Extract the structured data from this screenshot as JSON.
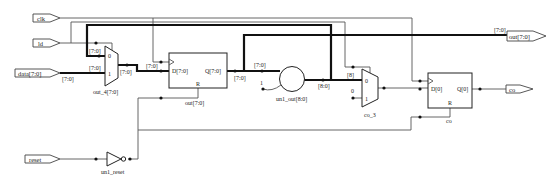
{
  "ports": {
    "inputs": [
      {
        "name": "clk",
        "label": "clk"
      },
      {
        "name": "ld",
        "label": "ld"
      },
      {
        "name": "data",
        "label": "data[7:0]"
      },
      {
        "name": "reset",
        "label": "reset"
      }
    ],
    "outputs": [
      {
        "name": "out",
        "label": "out[7:0]"
      },
      {
        "name": "co",
        "label": "co"
      }
    ]
  },
  "instances": {
    "mux_out4": {
      "label": "out_4[7:0]",
      "pin0": "0",
      "pin1": "1"
    },
    "reg_out": {
      "label": "out[7:0]",
      "pin_d": "D[7:0]",
      "pin_q": "Q[7:0]",
      "pin_r": "R"
    },
    "adder": {
      "label": "un1_out[8:0]",
      "const_in": "1"
    },
    "mux_co3": {
      "label": "co_3",
      "pin0": "0",
      "pin1": "1",
      "const_in": "0"
    },
    "ff_co": {
      "label": "co",
      "pin_d": "D[0]",
      "pin_q": "Q[0]",
      "pin_r": "R"
    },
    "inv_reset": {
      "label": "un1_reset"
    }
  },
  "bus_labels": {
    "data_in": "[7:0]",
    "mux_in1": "[7:0]",
    "mux_in0": "[7:0]",
    "mux_out": "[7:0]",
    "reg_d": "[7:0]",
    "reg_q": "[7:0]",
    "adder_in": "[7:0]",
    "adder_out": "[8:0]",
    "carry_bit": "[8]",
    "out_port": "[7:0]"
  },
  "colors": {
    "wire": "#555555",
    "bus": "#111111",
    "background": "#ffffff"
  }
}
